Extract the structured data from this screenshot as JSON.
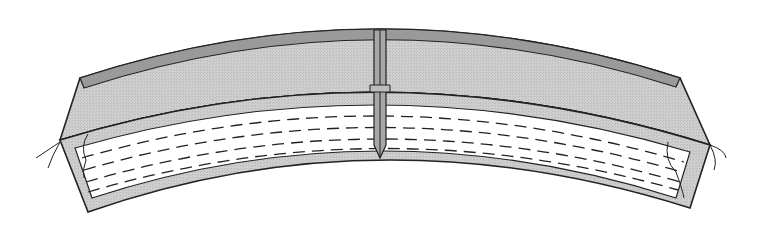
{
  "figure": {
    "colors": {
      "background": "#ffffff",
      "face_fill": "#c8c8c8",
      "rim_fill": "#9a9a9a",
      "inner_fill": "#ffffff",
      "outline": "#222222",
      "dash": "#222222"
    }
  }
}
